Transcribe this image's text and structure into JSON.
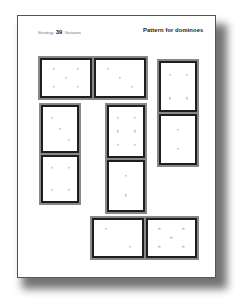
{
  "header": {
    "strategy_label": "Strategy",
    "strategy_number": "39",
    "variation_label": "Variation",
    "title": "Pattern for dominoes"
  },
  "colors": {
    "tile_frame": "#888888",
    "tile_border": "#1e1e1e",
    "pip": "#c8c8c8",
    "page": "#ffffff"
  },
  "dominoes": [
    {
      "id": "A",
      "orientation": "horizontal",
      "x": 38,
      "y": 56,
      "w": 110,
      "h": 44,
      "halves": [
        5,
        3
      ]
    },
    {
      "id": "B",
      "orientation": "vertical",
      "x": 157,
      "y": 59,
      "w": 42,
      "h": 108,
      "halves": [
        4,
        2
      ]
    },
    {
      "id": "C",
      "orientation": "vertical",
      "x": 39,
      "y": 103,
      "w": 42,
      "h": 102,
      "halves": [
        3,
        4
      ]
    },
    {
      "id": "D",
      "orientation": "vertical",
      "x": 105,
      "y": 103,
      "w": 42,
      "h": 111,
      "halves": [
        6,
        2
      ]
    },
    {
      "id": "E",
      "orientation": "horizontal",
      "x": 90,
      "y": 216,
      "w": 109,
      "h": 44,
      "halves": [
        2,
        5
      ]
    }
  ]
}
